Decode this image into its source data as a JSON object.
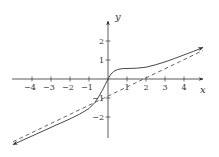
{
  "chart_data": {
    "type": "line",
    "title": "",
    "xlabel": "x",
    "ylabel": "y",
    "xlim": [
      -5.1,
      5.2
    ],
    "ylim": [
      -3.7,
      2.8
    ],
    "grid": false,
    "legend": null,
    "x_ticks": [
      -4,
      -3,
      -2,
      -1,
      1,
      2,
      3,
      4
    ],
    "x_tick_labels": [
      "−4",
      "−3",
      "−2",
      "−1",
      "1",
      "2",
      "3",
      "4"
    ],
    "y_ticks": [
      2,
      1,
      -1,
      -2
    ],
    "y_tick_labels": [
      "2",
      "1",
      "−1",
      "−2"
    ],
    "series": [
      {
        "name": "curve",
        "style": "solid",
        "color": "#333333",
        "x": [
          -5.0,
          -4.0,
          -3.0,
          -2.0,
          -1.5,
          -1.0,
          -0.7,
          -0.5,
          -0.3,
          -0.15,
          0.0,
          0.15,
          0.3,
          0.5,
          0.8,
          1.0,
          1.5,
          2.0,
          2.5,
          3.0,
          3.5,
          4.0,
          4.5,
          5.0
        ],
        "y": [
          -3.45,
          -3.0,
          -2.55,
          -2.1,
          -1.85,
          -1.55,
          -1.25,
          -0.95,
          -0.6,
          -0.3,
          0.0,
          0.25,
          0.4,
          0.5,
          0.55,
          0.55,
          0.57,
          0.62,
          0.75,
          0.9,
          1.08,
          1.27,
          1.46,
          1.66
        ]
      },
      {
        "name": "asymptote y = x - 2 (scaled)",
        "style": "dashed",
        "color": "#555555",
        "x": [
          -5.0,
          5.0
        ],
        "y": [
          -3.3,
          1.5
        ]
      }
    ],
    "annotations": []
  }
}
